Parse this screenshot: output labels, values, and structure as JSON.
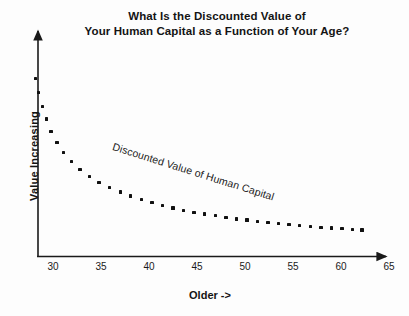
{
  "chart_data": {
    "type": "scatter",
    "title": "What Is the Discounted Value of Your Human Capital as a Function of Your Age?",
    "title_lines": [
      "What Is the Discounted Value of",
      "Your Human Capital as a Function of Your Age?"
    ],
    "xlabel": "Older ->",
    "ylabel": "Value Increasing",
    "xlim": [
      28,
      66
    ],
    "ylim": [
      0,
      100
    ],
    "grid": false,
    "legend": "inline-annotation",
    "xticks": [
      30,
      35,
      40,
      45,
      50,
      55,
      60,
      65
    ],
    "xtick_labels": [
      "30",
      "35",
      "40",
      "45",
      "50",
      "55",
      "60",
      "65"
    ],
    "yticks": [],
    "ytick_labels": [],
    "annotations": [
      {
        "text": "Discounted Value of Human Capital",
        "x": 37.5,
        "y": 62,
        "rotation_deg": -17.5
      }
    ],
    "series": [
      {
        "name": "Discounted Value of Human Capital",
        "marker": "square-dot",
        "color": "#111111",
        "x": [
          28.2,
          28.5,
          28.9,
          29.3,
          29.8,
          30.4,
          31.1,
          31.9,
          32.8,
          33.8,
          34.8,
          35.9,
          37.0,
          38.1,
          39.2,
          40.3,
          41.4,
          42.5,
          43.6,
          44.7,
          45.8,
          46.9,
          48.0,
          49.1,
          50.2,
          51.3,
          52.4,
          53.5,
          54.6,
          55.7,
          56.8,
          57.9,
          59.0,
          60.1,
          61.2,
          62.2
        ],
        "y": [
          96.5,
          89.0,
          81.5,
          74.5,
          68.0,
          62.0,
          56.5,
          51.5,
          47.2,
          43.5,
          40.3,
          37.5,
          35.1,
          33.0,
          31.1,
          29.4,
          27.9,
          26.5,
          25.3,
          24.2,
          23.2,
          22.3,
          21.4,
          20.6,
          19.9,
          19.2,
          18.6,
          18.0,
          17.5,
          17.0,
          16.5,
          16.1,
          15.7,
          15.3,
          15.0,
          14.7
        ]
      }
    ]
  },
  "axes": {
    "y_arrow": "up-arrow-icon",
    "x_arrow": "right-arrow-icon"
  }
}
